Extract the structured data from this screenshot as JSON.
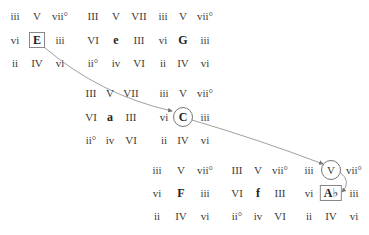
{
  "diagram": {
    "grids": [
      {
        "key": "E",
        "mode": "major",
        "cells": [
          [
            "iii",
            "V",
            "vii°"
          ],
          [
            "vi",
            "E",
            "iii"
          ],
          [
            "ii",
            "IV",
            "vi"
          ]
        ],
        "x": [
          15,
          37,
          60
        ],
        "y": [
          16,
          40,
          63
        ],
        "highlight": "box"
      },
      {
        "key": "e",
        "mode": "minor",
        "cells": [
          [
            "III",
            "V",
            "VII"
          ],
          [
            "VI",
            "e",
            "III"
          ],
          [
            "ii°",
            "iv",
            "VI"
          ]
        ],
        "x": [
          93,
          116,
          139
        ],
        "y": [
          16,
          40,
          63
        ],
        "highlight": "none"
      },
      {
        "key": "G",
        "mode": "major",
        "cells": [
          [
            "iii",
            "V",
            "vii°"
          ],
          [
            "vi",
            "G",
            "iii"
          ],
          [
            "ii",
            "IV",
            "vi"
          ]
        ],
        "x": [
          163,
          183,
          205
        ],
        "y": [
          16,
          40,
          63
        ],
        "highlight": "none"
      },
      {
        "key": "a",
        "mode": "minor",
        "cells": [
          [
            "III",
            "V",
            "VII"
          ],
          [
            "VI",
            "a",
            "III"
          ],
          [
            "ii°",
            "iv",
            "VI"
          ]
        ],
        "x": [
          91,
          110,
          131
        ],
        "y": [
          93,
          117,
          140
        ],
        "highlight": "none"
      },
      {
        "key": "C",
        "mode": "major",
        "cells": [
          [
            "iii",
            "V",
            "vii°"
          ],
          [
            "vi",
            "C",
            "iii"
          ],
          [
            "ii",
            "IV",
            "vi"
          ]
        ],
        "x": [
          164,
          183,
          205
        ],
        "y": [
          93,
          117,
          140
        ],
        "highlight": "circle-center"
      },
      {
        "key": "F",
        "mode": "major",
        "cells": [
          [
            "iii",
            "V",
            "vii°"
          ],
          [
            "vi",
            "F",
            "iii"
          ],
          [
            "ii",
            "IV",
            "vi"
          ]
        ],
        "x": [
          157,
          181,
          205
        ],
        "y": [
          170,
          193,
          216
        ],
        "highlight": "none"
      },
      {
        "key": "f",
        "mode": "minor",
        "cells": [
          [
            "III",
            "V",
            "vii°"
          ],
          [
            "VI",
            "f",
            "III"
          ],
          [
            "ii°",
            "iv",
            "VI"
          ]
        ],
        "x": [
          237,
          258,
          280
        ],
        "y": [
          170,
          193,
          216
        ],
        "highlight": "none"
      },
      {
        "key": "A♭",
        "mode": "major",
        "cells": [
          [
            "iii",
            "V",
            "vii°"
          ],
          [
            "vi",
            "A♭",
            "iii"
          ],
          [
            "ii",
            "IV",
            "vi"
          ]
        ],
        "x": [
          309,
          331,
          354
        ],
        "y": [
          170,
          193,
          216
        ],
        "highlight": "box-center-circle-top"
      }
    ],
    "arrows": [
      {
        "from": "E",
        "to": "C"
      },
      {
        "from": "C",
        "to": "V (A♭)"
      },
      {
        "from": "V (A♭)",
        "to": "A♭"
      }
    ],
    "colors": {
      "text": "#3a3a3a",
      "line": "#777777",
      "box": "#888888"
    }
  }
}
